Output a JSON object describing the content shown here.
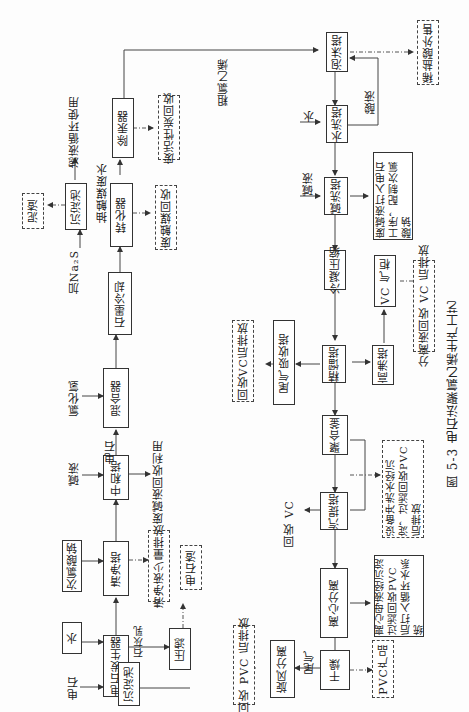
{
  "figure": {
    "caption": "图 5-3   电石法聚氯乙烯生产工艺",
    "nodes": {
      "dianshi_fashengqi": "电石发生器",
      "shui": "水",
      "dianshi_in": "电石",
      "cidianjiang": "石灰乳",
      "chendianchi1": "沉淀池",
      "yalv": "压滤",
      "dianshizha": "电石渣",
      "cilvsuanna": "次氯酸钠",
      "qingjingta": "清净塔",
      "qingjingye": "清净液少量排放",
      "jianye1": "碱液",
      "zhongheta": "中和塔",
      "feijianye_huishou": "废碱液回收利用",
      "dianshi2": "电石",
      "lvhuaqing": "氯化氢",
      "hunheqi": "混合器",
      "shimolengque": "石墨冷却",
      "jia_na2s": "加Na₂S",
      "zhuanhuaqi": "转化器",
      "feichumo_huishou": "废触媒回收",
      "chumo_feishui": "抽触媒废水",
      "chendianchi2": "沉淀池",
      "nizha": "泥渣",
      "lvye_xunhuan": "滤液循环使用",
      "chugongqi": "除汞器",
      "feihuoxingtan": "废活性炭回收",
      "culvyixi": "粗氯乙烯",
      "paomota": "泡沫塔",
      "xiyansuan": "稀盐酸外售",
      "suanye": "酸液",
      "shui2": "水",
      "shuixita": "水洗塔",
      "jianye2": "碱液",
      "jianxita": "碱洗塔",
      "feijianye_note": "废碱液打入电石工序，配制次氯酸钠",
      "lengningyasuo": "冷凝压缩",
      "vc_qigui": "VC 气柜",
      "fenliye": "分离液回收 VC 后排放",
      "jingliuta": "精馏塔",
      "gaofeita": "高沸塔",
      "weiqi_xishouta": "尾气吸收塔",
      "huishou_vc_paifang": "回收VC后排放",
      "juhefu": "聚合釜",
      "shebei_chongxi": "设备冲洗水经沉淀，过滤回收PVC后排放",
      "qitita": "汽提塔",
      "huishou_vc": "回收 VC",
      "lixin_fenli": "离心分离",
      "lixin_muye": "离心母液经沉淀过滤回收PVC后打入循环水系统",
      "ganzao": "干燥",
      "weiqi": "尾气",
      "xuanfeng_fenli": "旋风分离",
      "huishou_pvc": "回收 PVC 后排放",
      "pvc_chanpin": "PVC产品"
    }
  }
}
